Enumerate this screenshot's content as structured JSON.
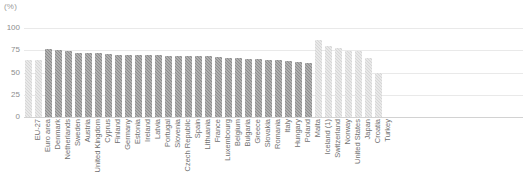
{
  "unit_label": "(%)",
  "colors": {
    "bar_aggregate": "#d6d6d6",
    "bar_member_state": "#8d8d8d",
    "bar_non_eu": "#d6d6d6",
    "gridline": "#e9e9e9",
    "axis": "#d2d2d2",
    "tick_text": "#8d8d8d",
    "category_text": "#6f6f6f"
  },
  "chart_data": {
    "type": "bar",
    "title": "",
    "subtitle": "",
    "xlabel": "",
    "ylabel": "(%)",
    "ylim": [
      0,
      100
    ],
    "yticks": [
      0,
      25,
      50,
      75,
      100
    ],
    "grid": true,
    "legend_position": "none",
    "categories": [
      "EU-27",
      "Euro area",
      "Denmark",
      "Netherlands",
      "Sweden",
      "Austria",
      "United Kingdom",
      "Cyprus",
      "Finland",
      "Germany",
      "Estonia",
      "Ireland",
      "Latvia",
      "Portugal",
      "Slovenia",
      "Czech Republic",
      "Spain",
      "Lithuania",
      "France",
      "Luxembourg",
      "Belgium",
      "Bulgaria",
      "Greece",
      "Slovakia",
      "Romania",
      "Italy",
      "Hungary",
      "Poland",
      "Malta",
      "Iceland (1)",
      "Switzerland",
      "Norway",
      "United States",
      "Japan",
      "Croatia",
      "Turkey"
    ],
    "values": [
      64,
      64,
      76,
      75,
      74,
      72,
      72,
      72,
      71,
      70,
      70,
      70,
      70,
      70,
      69,
      69,
      68,
      68,
      68,
      67,
      66,
      66,
      65,
      65,
      64,
      64,
      63,
      62,
      61,
      86,
      80,
      78,
      74,
      74,
      66,
      50
    ],
    "groups": [
      "aggregate",
      "aggregate",
      "member",
      "member",
      "member",
      "member",
      "member",
      "member",
      "member",
      "member",
      "member",
      "member",
      "member",
      "member",
      "member",
      "member",
      "member",
      "member",
      "member",
      "member",
      "member",
      "member",
      "member",
      "member",
      "member",
      "member",
      "member",
      "member",
      "member",
      "non_eu",
      "non_eu",
      "non_eu",
      "non_eu",
      "non_eu",
      "non_eu",
      "non_eu"
    ]
  }
}
